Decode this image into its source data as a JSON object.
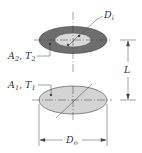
{
  "diagram": {
    "labels": {
      "inner_diameter": "D",
      "inner_diameter_sub": "i",
      "top_surface": "A",
      "top_surface_sub_a": "2",
      "top_surface_sep": ", T",
      "top_surface_sub_t": "2",
      "bottom_surface": "A",
      "bottom_surface_sub_a": "1",
      "bottom_surface_sep": ", T",
      "bottom_surface_sub_t": "1",
      "separation": "L",
      "outer_diameter": "D",
      "outer_diameter_sub": "o"
    },
    "colors": {
      "annulus": "#6e6e6e",
      "inner_disk": "#d9d9d9",
      "bottom_disk": "#d4d4d4",
      "lines": "#444444"
    }
  }
}
